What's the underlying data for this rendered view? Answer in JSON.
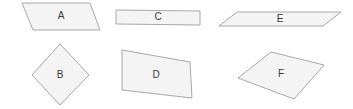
{
  "canvas": {
    "width": 353,
    "height": 109,
    "background_color": "#ffffff"
  },
  "style": {
    "shape_fill": "#f4f4f4",
    "shape_stroke": "#a8a8a8",
    "label_color": "#3a3a3a",
    "label_font_size": 10
  },
  "diagram": {
    "type": "quadrilateral-shape-set",
    "shape_count": 6,
    "rows": 2,
    "columns": 3,
    "shapes": [
      {
        "id": "A",
        "label": "A",
        "kind": "parallelogram",
        "row": 1,
        "column": 1,
        "points": "22,3 90,3 100,30 33,30",
        "label_x": 61,
        "label_y": 16
      },
      {
        "id": "C",
        "label": "C",
        "kind": "rectangle",
        "row": 1,
        "column": 2,
        "points": "116,10 200,11 200,25 116,24",
        "label_x": 158,
        "label_y": 17
      },
      {
        "id": "E",
        "label": "E",
        "kind": "parallelogram",
        "row": 1,
        "column": 3,
        "points": "237,12 341,12 323,26 219,26",
        "label_x": 280,
        "label_y": 19
      },
      {
        "id": "B",
        "label": "B",
        "kind": "rhombus",
        "row": 2,
        "column": 1,
        "points": "60,44 89,75 60,105 32,75",
        "label_x": 60,
        "label_y": 75
      },
      {
        "id": "D",
        "label": "D",
        "kind": "trapezoid",
        "row": 2,
        "column": 2,
        "points": "122,50 190,62 192,98 122,90",
        "label_x": 156,
        "label_y": 75
      },
      {
        "id": "F",
        "label": "F",
        "kind": "parallelogram",
        "row": 2,
        "column": 3,
        "points": "271,52 324,65 294,99 238,78",
        "label_x": 281,
        "label_y": 74
      }
    ]
  }
}
